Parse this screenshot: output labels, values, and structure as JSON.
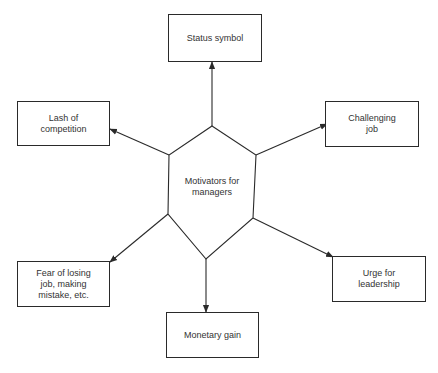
{
  "diagram": {
    "type": "hub-and-spoke",
    "center": {
      "label": "Motivators for\nmanagers",
      "shape": "hexagon"
    },
    "nodes": [
      {
        "id": "status",
        "label": "Status symbol"
      },
      {
        "id": "competition",
        "label": "Lash of\ncompetition"
      },
      {
        "id": "challenging",
        "label": "Challenging\njob"
      },
      {
        "id": "fear",
        "label": "Fear of losing\njob, making\nmistake, etc."
      },
      {
        "id": "leadership",
        "label": "Urge for\nleadership"
      },
      {
        "id": "monetary",
        "label": "Monetary gain"
      }
    ],
    "edges": [
      {
        "from": "center",
        "to": "status"
      },
      {
        "from": "center",
        "to": "competition"
      },
      {
        "from": "center",
        "to": "challenging"
      },
      {
        "from": "center",
        "to": "fear"
      },
      {
        "from": "center",
        "to": "leadership"
      },
      {
        "from": "center",
        "to": "monetary"
      }
    ],
    "colors": {
      "line": "#2a2a2a",
      "text": "#333333",
      "background": "#ffffff"
    }
  }
}
